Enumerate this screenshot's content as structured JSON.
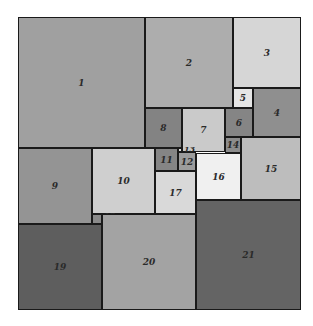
{
  "diagram": {
    "type": "squared-rectangle",
    "squares": [
      {
        "label": "1",
        "x": 18,
        "y": 17,
        "w": 127,
        "h": 131,
        "color": "#a0a0a0"
      },
      {
        "label": "2",
        "x": 145,
        "y": 17,
        "w": 88,
        "h": 91,
        "color": "#adadad"
      },
      {
        "label": "3",
        "x": 233,
        "y": 17,
        "w": 68,
        "h": 71,
        "color": "#d6d6d6"
      },
      {
        "label": "4",
        "x": 253,
        "y": 88,
        "w": 48,
        "h": 49,
        "color": "#8f8f8f"
      },
      {
        "label": "5",
        "x": 233,
        "y": 88,
        "w": 20,
        "h": 20,
        "color": "#e6e6e6"
      },
      {
        "label": "6",
        "x": 225,
        "y": 108,
        "w": 28,
        "h": 29,
        "color": "#858585"
      },
      {
        "label": "7",
        "x": 182,
        "y": 108,
        "w": 43,
        "h": 44,
        "color": "#cacaca"
      },
      {
        "label": "8",
        "x": 145,
        "y": 108,
        "w": 37,
        "h": 40,
        "color": "#838383"
      },
      {
        "label": "9",
        "x": 18,
        "y": 148,
        "w": 74,
        "h": 76,
        "color": "#949494"
      },
      {
        "label": "10",
        "x": 92,
        "y": 148,
        "w": 63,
        "h": 66,
        "color": "#cfcfcf"
      },
      {
        "label": "11",
        "x": 155,
        "y": 148,
        "w": 23,
        "h": 23,
        "color": "#858585"
      },
      {
        "label": "12",
        "x": 178,
        "y": 152,
        "w": 18,
        "h": 19,
        "color": "#9c9c9c"
      },
      {
        "label": "13",
        "x": 178,
        "y": 148,
        "w": 4,
        "h": 4,
        "color": "#e0e0e0"
      },
      {
        "label": "14",
        "x": 225,
        "y": 137,
        "w": 16,
        "h": 16,
        "color": "#8c8c8c"
      },
      {
        "label": "15",
        "x": 241,
        "y": 137,
        "w": 60,
        "h": 63,
        "color": "#bdbdbd"
      },
      {
        "label": "16",
        "x": 196,
        "y": 153,
        "w": 45,
        "h": 47,
        "color": "#f0f0f0"
      },
      {
        "label": "17",
        "x": 155,
        "y": 171,
        "w": 41,
        "h": 43,
        "color": "#d9d9d9"
      },
      {
        "label": "18",
        "x": 92,
        "y": 214,
        "w": 10,
        "h": 10,
        "color": "#8a8a8a"
      },
      {
        "label": "19",
        "x": 18,
        "y": 224,
        "w": 84,
        "h": 86,
        "color": "#5e5e5e"
      },
      {
        "label": "20",
        "x": 102,
        "y": 214,
        "w": 94,
        "h": 96,
        "color": "#a3a3a3"
      },
      {
        "label": "21",
        "x": 196,
        "y": 200,
        "w": 105,
        "h": 110,
        "color": "#646464"
      }
    ],
    "outer": {
      "x": 18,
      "y": 17,
      "w": 283,
      "h": 293
    }
  }
}
